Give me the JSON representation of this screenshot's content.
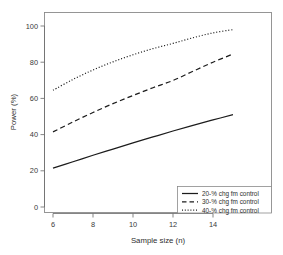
{
  "chart_data": {
    "type": "line",
    "title": "",
    "xlabel": "Sample size (n)",
    "ylabel": "Power (%)",
    "xlim": [
      5.6,
      15.4
    ],
    "ylim": [
      -3,
      104
    ],
    "xticks": [
      6,
      8,
      10,
      12,
      14
    ],
    "yticks": [
      0,
      20,
      40,
      60,
      80,
      100
    ],
    "grid": false,
    "legend_position": "bottom-right",
    "x": [
      6,
      7,
      8,
      9,
      10,
      11,
      12,
      13,
      14,
      15
    ],
    "series": [
      {
        "name": "20-% chg fm control",
        "style": "solid",
        "color": "#1c1c1c",
        "values": [
          21.5,
          25.0,
          28.6,
          32.0,
          35.4,
          38.7,
          42.0,
          45.1,
          48.1,
          51.0
        ]
      },
      {
        "name": "30-% chg fm control",
        "style": "dashed",
        "color": "#1c1c1c",
        "values": [
          41.5,
          47.0,
          52.2,
          57.1,
          61.6,
          65.9,
          69.9,
          75.0,
          80.0,
          84.5
        ]
      },
      {
        "name": "40-% chg fm control",
        "style": "dotted",
        "color": "#1c1c1c",
        "values": [
          64.5,
          70.5,
          75.7,
          80.2,
          84.1,
          87.5,
          90.4,
          93.5,
          96.2,
          98.0
        ]
      }
    ]
  },
  "axes": {
    "xlabel": "Sample size (n)",
    "ylabel": "Power (%)",
    "xtick_labels": [
      "6",
      "8",
      "10",
      "12",
      "14"
    ],
    "ytick_labels": [
      "0",
      "20",
      "40",
      "60",
      "80",
      "100"
    ]
  },
  "legend": {
    "entries": [
      {
        "label": "20-% chg fm control",
        "style": "solid"
      },
      {
        "label": "30-% chg fm control",
        "style": "dashed"
      },
      {
        "label": "40-% chg fm control",
        "style": "dotted"
      }
    ]
  },
  "colors": {
    "background": "#ffffff",
    "line": "#1c1c1c",
    "axis": "#6f6f6f",
    "frame": "#8a8a8a",
    "text": "#2e2e2e"
  }
}
